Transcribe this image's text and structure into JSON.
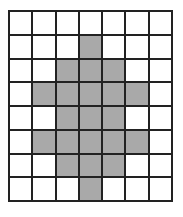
{
  "grid": {
    "rows": 8,
    "cols": 7,
    "fill_color": "#a9a9a9",
    "empty_color": "#ffffff",
    "line_color": "#222222",
    "shaded": [
      [
        0,
        0,
        0,
        0,
        0,
        0,
        0
      ],
      [
        0,
        0,
        0,
        1,
        0,
        0,
        0
      ],
      [
        0,
        0,
        1,
        1,
        1,
        0,
        0
      ],
      [
        0,
        1,
        1,
        1,
        1,
        1,
        0
      ],
      [
        0,
        0,
        1,
        1,
        1,
        0,
        0
      ],
      [
        0,
        1,
        1,
        1,
        1,
        1,
        0
      ],
      [
        0,
        0,
        1,
        1,
        1,
        0,
        0
      ],
      [
        0,
        0,
        0,
        1,
        0,
        0,
        0
      ]
    ]
  }
}
